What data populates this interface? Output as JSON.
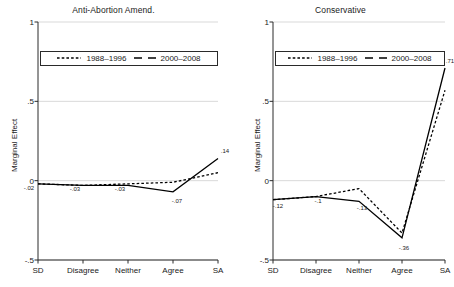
{
  "figure": {
    "width": 454,
    "height": 287,
    "background": "#ffffff",
    "axis_color": "#2a2a2a",
    "grid_color": "#d9d9d9",
    "series_colors": [
      "#000000",
      "#000000"
    ]
  },
  "ylabel": "Marginal Effect",
  "yticks": [
    "1",
    ".5",
    "0",
    "-.5"
  ],
  "ytick_values": [
    1,
    0.5,
    0,
    -0.5
  ],
  "xticks": [
    "SD",
    "Disagree",
    "Neither",
    "Agree",
    "SA"
  ],
  "legend": {
    "entries": [
      {
        "label": "1988–1996",
        "style": "dotted"
      },
      {
        "label": "2000–2008",
        "style": "dashed"
      }
    ]
  },
  "chart_data": [
    {
      "type": "line",
      "title": "Anti-Abortion Amend.",
      "xlabel": "",
      "ylabel": "Marginal Effect",
      "categories": [
        "SD",
        "Disagree",
        "Neither",
        "Agree",
        "SA"
      ],
      "ylim": [
        -0.5,
        1
      ],
      "yticks": [
        -0.5,
        0,
        0.5,
        1
      ],
      "grid": true,
      "legend_position": "top-inside",
      "series": [
        {
          "name": "1988–1996",
          "style": "dotted",
          "values": [
            -0.02,
            -0.03,
            -0.02,
            -0.01,
            0.05
          ]
        },
        {
          "name": "2000–2008",
          "style": "solid",
          "values": [
            -0.02,
            -0.03,
            -0.03,
            -0.07,
            0.14
          ]
        }
      ],
      "annotations": [
        {
          "text": "-.02",
          "category": "SD",
          "value": -0.02
        },
        {
          "text": "-.03",
          "category": "Disagree",
          "value": -0.03
        },
        {
          "text": "-.03",
          "category": "Neither",
          "value": -0.03
        },
        {
          "text": "-.07",
          "category": "Agree",
          "value": -0.07
        },
        {
          "text": ".14",
          "category": "SA",
          "value": 0.14
        }
      ]
    },
    {
      "type": "line",
      "title": "Conservative",
      "xlabel": "",
      "ylabel": "Marginal Effect",
      "categories": [
        "SD",
        "Disagree",
        "Neither",
        "Agree",
        "SA"
      ],
      "ylim": [
        -0.5,
        1
      ],
      "yticks": [
        -0.5,
        0,
        0.5,
        1
      ],
      "grid": true,
      "legend_position": "top-inside",
      "series": [
        {
          "name": "1988–1996",
          "style": "dotted",
          "values": [
            -0.12,
            -0.1,
            -0.05,
            -0.33,
            0.57
          ]
        },
        {
          "name": "2000–2008",
          "style": "solid",
          "values": [
            -0.12,
            -0.1,
            -0.13,
            -0.36,
            0.71
          ]
        }
      ],
      "annotations": [
        {
          "text": "-.12",
          "category": "SD",
          "value": -0.12
        },
        {
          "text": "-.1",
          "category": "Disagree",
          "value": -0.1
        },
        {
          "text": "-.13",
          "category": "Neither",
          "value": -0.13
        },
        {
          "text": "-.36",
          "category": "Agree",
          "value": -0.36
        },
        {
          "text": ".71",
          "category": "SA",
          "value": 0.71
        }
      ]
    }
  ]
}
